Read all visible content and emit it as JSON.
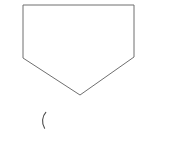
{
  "canvas": {
    "width": 185,
    "height": 142,
    "background_color": "#ffffff"
  },
  "figure": {
    "name": "pentagon",
    "stroke_color": "#6f6f6f",
    "fill_color": "#ffffff",
    "stroke_width": 1,
    "points": "23,5 134,5 134,57 80,95 23,58",
    "vertices": [
      {
        "label": "top-left",
        "x": 23,
        "y": 5
      },
      {
        "label": "top-right",
        "x": 134,
        "y": 5
      },
      {
        "label": "right-shoulder",
        "x": 134,
        "y": 57
      },
      {
        "label": "bottom-apex",
        "x": 80,
        "y": 95
      },
      {
        "label": "left-shoulder",
        "x": 23,
        "y": 58
      }
    ]
  },
  "annotation": {
    "name": "left-parenthesis-mark",
    "glyph": "(",
    "stroke_color": "#4a4a4a",
    "path": "M45.8,112.4 C42.2,116.2 41.3,123.0 44.6,128.2",
    "x": 41,
    "y": 112,
    "width": 6,
    "height": 17
  }
}
